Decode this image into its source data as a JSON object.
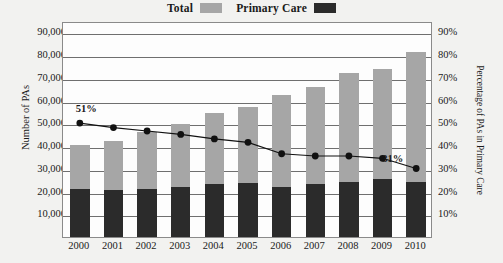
{
  "legend": {
    "items": [
      {
        "label": "Total",
        "swatch": "total-swatch",
        "color": "#a6a6a6"
      },
      {
        "label": "Primary Care",
        "swatch": "primary-care-swatch",
        "color": "#2b2b2b"
      }
    ]
  },
  "chart_data": {
    "type": "bar",
    "title": "",
    "xlabel": "",
    "ylabel": "Number of PAs",
    "y2label": "Percentage of PAs in Primary Care",
    "categories": [
      "2000",
      "2001",
      "2002",
      "2003",
      "2004",
      "2005",
      "2006",
      "2007",
      "2008",
      "2009",
      "2010"
    ],
    "ylim": [
      0,
      95000
    ],
    "y2lim": [
      0,
      95
    ],
    "yticks": [
      "10,000",
      "20,000",
      "30,000",
      "40,000",
      "50,000",
      "60,000",
      "70,000",
      "80,000",
      "90,000"
    ],
    "ytick_values": [
      10000,
      20000,
      30000,
      40000,
      50000,
      60000,
      70000,
      80000,
      90000
    ],
    "y2ticks": [
      "10%",
      "20%",
      "30%",
      "40%",
      "50%",
      "60%",
      "70%",
      "80%",
      "90%"
    ],
    "y2tick_values": [
      10,
      20,
      30,
      40,
      50,
      60,
      70,
      80,
      90
    ],
    "grid": true,
    "legend_position": "top-center",
    "series": [
      {
        "name": "Total",
        "type": "bar",
        "axis": "left",
        "color": "#a6a6a6",
        "values": [
          40500,
          42300,
          46000,
          49800,
          54400,
          57400,
          62500,
          66000,
          72200,
          73800,
          81500
        ]
      },
      {
        "name": "Primary Care",
        "type": "bar",
        "axis": "left",
        "color": "#2b2b2b",
        "values": [
          21000,
          20600,
          21000,
          22000,
          23200,
          23800,
          22100,
          23100,
          24300,
          25400,
          24300
        ]
      },
      {
        "name": "Percentage of PAs in Primary Care",
        "type": "line",
        "axis": "right",
        "color": "#111111",
        "values": [
          51,
          49,
          47.5,
          46,
          44,
          42.5,
          37.5,
          36.5,
          36.5,
          35.5,
          31
        ]
      }
    ],
    "annotations": [
      {
        "text": "51%",
        "x": "2000",
        "value": 51
      },
      {
        "text": "31%",
        "x": "2010",
        "value": 31
      }
    ]
  }
}
